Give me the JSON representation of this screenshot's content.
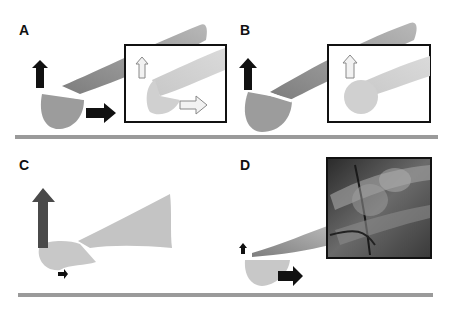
{
  "figure": {
    "panels": [
      {
        "id": "A",
        "label": "A",
        "description": "Fracture with dorsal (upward) and horizontal displacement; inset shows reduced position with outlined arrows"
      },
      {
        "id": "B",
        "label": "B",
        "description": "Fracture with dorsal displacement only; inset shows reduced position with outlined up arrow"
      },
      {
        "id": "C",
        "label": "C",
        "description": "Angulated fracture with large dorsal force and small horizontal force"
      },
      {
        "id": "D",
        "label": "D",
        "description": "Fracture with small dorsal and horizontal displacement; radiograph inset"
      }
    ],
    "colors": {
      "background": "#ffffff",
      "bone_dark": "#8c8c8c",
      "bone_light": "#c4c4c4",
      "arrow_solid": "#111111",
      "arrow_dark_gray": "#4a4a4a",
      "arrow_outline_fill": "#f2f2f2",
      "ground_line": "#9a9a9a",
      "inset_border": "#111111"
    }
  }
}
